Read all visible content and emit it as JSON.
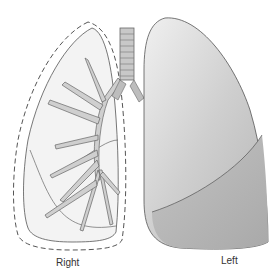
{
  "diagram": {
    "labels": {
      "right": "Right",
      "left": "Left"
    },
    "colors": {
      "left_lung_upper": "#d9d9d9",
      "left_lung_lower": "#bdbdbd",
      "right_lung_fill": "#f2f2f2",
      "bronchi": "#c8c8c8",
      "outline": "#555555"
    }
  }
}
